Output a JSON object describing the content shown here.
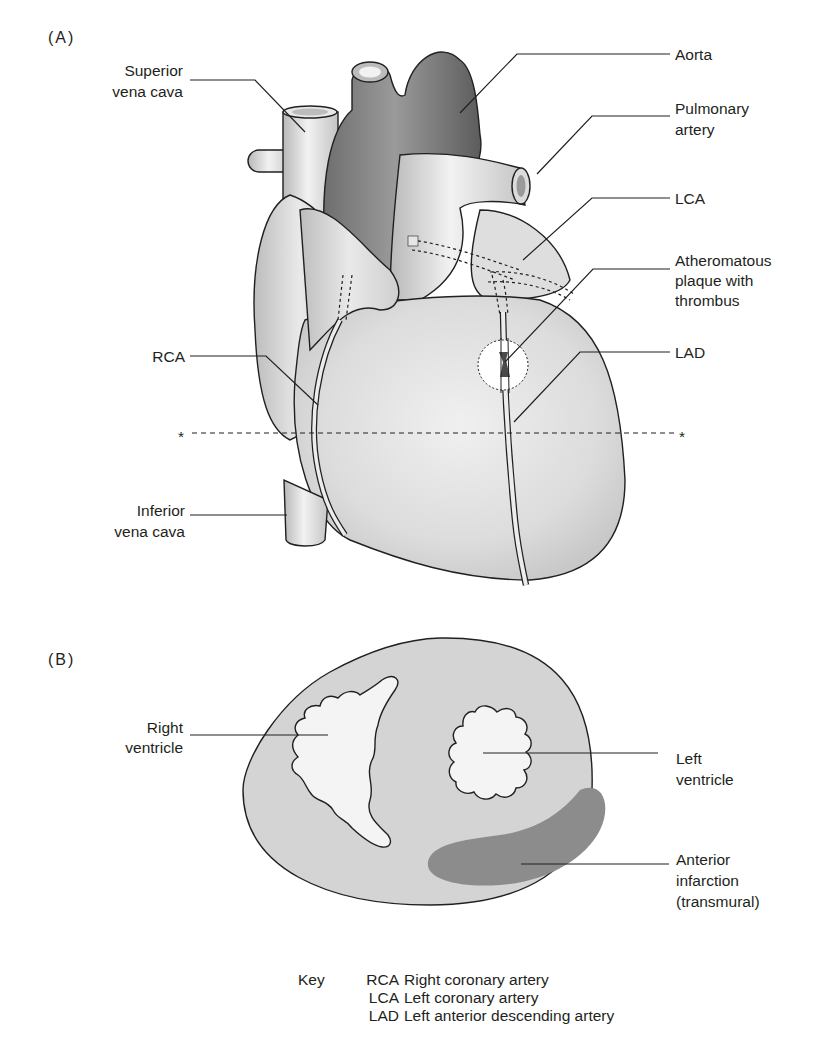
{
  "figure": {
    "panel_a": {
      "label": "(A)",
      "labels": {
        "superior_vena_cava": [
          "Superior",
          "vena cava"
        ],
        "aorta": "Aorta",
        "pulmonary_artery": [
          "Pulmonary",
          "artery"
        ],
        "lca": "LCA",
        "plaque": [
          "Atheromatous",
          "plaque with",
          "thrombus"
        ],
        "rca": "RCA",
        "lad": "LAD",
        "inferior_vena_cava": [
          "Inferior",
          "vena cava"
        ],
        "section_marker": "*"
      }
    },
    "panel_b": {
      "label": "(B)",
      "labels": {
        "right_ventricle": [
          "Right",
          "ventricle"
        ],
        "left_ventricle": [
          "Left",
          "ventricle"
        ],
        "infarction": [
          "Anterior",
          "infarction",
          "(transmural)"
        ]
      }
    },
    "key": {
      "title": "Key",
      "entries": [
        {
          "abbr": "RCA",
          "meaning": "Right coronary artery"
        },
        {
          "abbr": "LCA",
          "meaning": "Left coronary artery"
        },
        {
          "abbr": "LAD",
          "meaning": "Left anterior descending artery"
        }
      ]
    },
    "colors": {
      "myocardium": "#d9d9d9",
      "vessel_dark": "#8a8a8a",
      "vessel_light": "#e6e6e6",
      "infarct": "#8c8c8c",
      "cavity": "#f4f4f4",
      "line": "#231f20"
    }
  }
}
